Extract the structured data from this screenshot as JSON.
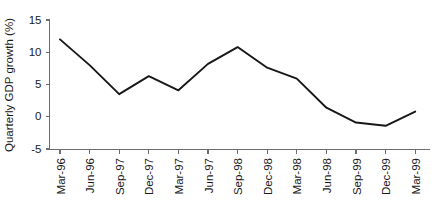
{
  "chart_data": {
    "type": "line",
    "title": "",
    "xlabel": "",
    "ylabel": "Quarterly GDP growth (%)",
    "ylim": [
      -5,
      15
    ],
    "yticks": [
      15,
      10,
      5,
      0,
      -5
    ],
    "ytick_labels": [
      "15",
      "10",
      "5",
      "0",
      "-5"
    ],
    "grid": false,
    "legend": "none",
    "categories": [
      "Mar-96",
      "Jun-96",
      "Sep-97",
      "Dec-97",
      "Mar-97",
      "Jun-97",
      "Sep-98",
      "Dec-98",
      "Mar-98",
      "Jun-98",
      "Sep-99",
      "Dec-99",
      "Mar-99"
    ],
    "values": [
      12.0,
      8.0,
      3.5,
      6.3,
      4.1,
      8.2,
      10.8,
      7.6,
      5.9,
      1.4,
      -0.9,
      -1.4,
      0.8
    ],
    "series": [
      {
        "name": "Quarterly GDP growth",
        "color": "#171717",
        "values": [
          12.0,
          8.0,
          3.5,
          6.3,
          4.1,
          8.2,
          10.8,
          7.6,
          5.9,
          1.4,
          -0.9,
          -1.4,
          0.8
        ]
      }
    ]
  },
  "style": {
    "axis_color": "#6e6e6e",
    "line_color": "#171717",
    "text_color": "#1a1a1a",
    "background": "#ffffff"
  }
}
